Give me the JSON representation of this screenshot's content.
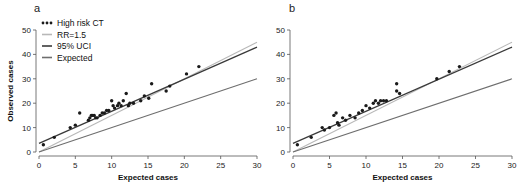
{
  "colors": {
    "points": "#1a1a1a",
    "rr": "#b8b8b8",
    "uci": "#3a3a3a",
    "expected": "#6e6e6e",
    "axis": "#555555"
  },
  "legend": {
    "items": [
      {
        "label": "High risk CT",
        "kind": "points"
      },
      {
        "label": "RR=1.5",
        "kind": "rr"
      },
      {
        "label": "95% UCI",
        "kind": "uci"
      },
      {
        "label": "Expected",
        "kind": "expected"
      }
    ]
  },
  "chart_data": [
    {
      "type": "scatter",
      "panel": "a",
      "title": "a",
      "xlabel": "Expected cases",
      "ylabel": "Observed cases",
      "xlim": [
        0,
        30
      ],
      "ylim": [
        0,
        50
      ],
      "xticks": [
        0,
        5,
        10,
        15,
        20,
        25,
        30
      ],
      "yticks": [
        0,
        10,
        20,
        30,
        40,
        50
      ],
      "grid": false,
      "legend_position": "upper left",
      "series": [
        {
          "name": "High risk CT",
          "kind": "points",
          "x": [
            0.6,
            2.1,
            4.3,
            5.0,
            5.6,
            6.8,
            7.0,
            7.2,
            7.4,
            7.6,
            7.8,
            8.0,
            8.4,
            8.7,
            9.0,
            9.3,
            9.6,
            10.0,
            10.2,
            10.4,
            10.8,
            11.0,
            11.3,
            11.6,
            12.0,
            12.3,
            12.5,
            13.0,
            14.0,
            14.5,
            15.1,
            15.5,
            17.5,
            18.0,
            20.3,
            22.0
          ],
          "y": [
            3,
            6,
            10,
            11,
            16,
            13,
            14,
            15,
            15,
            15,
            14,
            14,
            15,
            16,
            16,
            17,
            17,
            21,
            19,
            18,
            19,
            20,
            19,
            21,
            24,
            19,
            20,
            20,
            21,
            23,
            22,
            28,
            25,
            27,
            32,
            35
          ]
        },
        {
          "name": "RR=1.5",
          "kind": "rr",
          "x": [
            0,
            30
          ],
          "y": [
            0,
            45
          ]
        },
        {
          "name": "95% UCI",
          "kind": "uci",
          "x": [
            0,
            30
          ],
          "y": [
            3.5,
            43
          ]
        },
        {
          "name": "Expected",
          "kind": "expected",
          "x": [
            0,
            30
          ],
          "y": [
            0,
            30
          ]
        }
      ]
    },
    {
      "type": "scatter",
      "panel": "b",
      "title": "b",
      "xlabel": "Expected cases",
      "ylabel": "",
      "xlim": [
        0,
        30
      ],
      "ylim": [
        0,
        50
      ],
      "xticks": [
        0,
        5,
        10,
        15,
        20,
        25,
        30
      ],
      "yticks": [
        0,
        10,
        20,
        30,
        40,
        50
      ],
      "grid": false,
      "series": [
        {
          "name": "High risk CT",
          "kind": "points",
          "x": [
            0.6,
            2.5,
            4.0,
            4.3,
            5.0,
            5.6,
            5.9,
            6.1,
            6.3,
            6.8,
            7.2,
            7.8,
            8.5,
            9.0,
            9.5,
            10.0,
            10.5,
            11.0,
            11.3,
            11.7,
            12.0,
            12.4,
            12.8,
            14.2,
            14.2,
            14.6,
            19.7,
            21.4,
            22.8
          ],
          "y": [
            3,
            6,
            10,
            9,
            10,
            15,
            16,
            12,
            11,
            14,
            13,
            15,
            14,
            16,
            17,
            19,
            18,
            20,
            21,
            20,
            21,
            21,
            21,
            28,
            25,
            24,
            30,
            33,
            35
          ]
        },
        {
          "name": "RR=1.5",
          "kind": "rr",
          "x": [
            0,
            30
          ],
          "y": [
            0,
            45
          ]
        },
        {
          "name": "95% UCI",
          "kind": "uci",
          "x": [
            0,
            30
          ],
          "y": [
            3.5,
            43
          ]
        },
        {
          "name": "Expected",
          "kind": "expected",
          "x": [
            0,
            30
          ],
          "y": [
            0,
            30
          ]
        }
      ]
    }
  ]
}
